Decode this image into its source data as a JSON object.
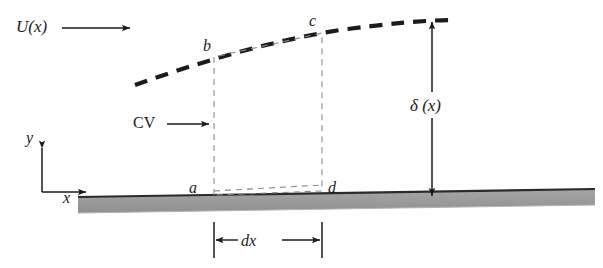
{
  "figure": {
    "background_color": "#ffffff",
    "ink_color": "#1b1b1b",
    "plate_fill_color": "#9c9c9c",
    "plate_edge_color": "#2b2b2b",
    "dashed_curve_color": "#1b1b1b",
    "cv_line_color": "#8a8a8a"
  },
  "labels": {
    "freestream": "U(x)",
    "control_volume": "CV",
    "boundary_thickness": "δ (x)",
    "element_width": "dx",
    "axis_y": "y",
    "axis_x": "x",
    "corner_a": "a",
    "corner_b": "b",
    "corner_c": "c",
    "corner_d": "d"
  },
  "geometry": {
    "plate": {
      "left_x": 78,
      "right_x": 595,
      "top_left_y": 197,
      "top_right_y": 189,
      "bottom_left_y": 213,
      "bottom_right_y": 205
    },
    "boundary_layer_curve": {
      "start": [
        135,
        85
      ],
      "end": [
        455,
        20
      ]
    },
    "control_volume": {
      "a": [
        214,
        195
      ],
      "b": [
        214,
        57
      ],
      "c": [
        322,
        33
      ],
      "d": [
        322,
        191
      ]
    },
    "delta_arrow": {
      "x": 432,
      "top_y": 22,
      "bottom_y": 196
    },
    "dx_dimension": {
      "left_x": 214,
      "right_x": 322,
      "y": 240
    },
    "axes": {
      "origin": [
        42,
        192
      ],
      "y_tip": [
        42,
        146
      ],
      "x_tip": [
        88,
        192
      ]
    },
    "u_arrow": {
      "start_x": 62,
      "end_x": 132,
      "y": 28
    },
    "cv_arrow": {
      "start_x": 167,
      "end_x": 210,
      "y": 124
    }
  }
}
